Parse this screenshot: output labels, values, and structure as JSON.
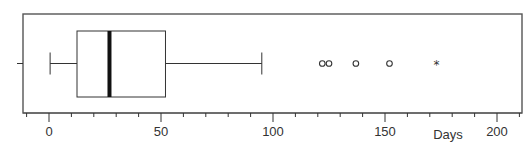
{
  "chart_data": {
    "type": "boxplot",
    "title": "",
    "xlabel": "Days",
    "ylabel": "",
    "orientation": "horizontal",
    "xlim": [
      -12,
      210
    ],
    "grid": false,
    "major_ticks": [
      0,
      50,
      100,
      150,
      200
    ],
    "tick_labels": [
      "0",
      "50",
      "100",
      "150",
      "200"
    ],
    "minor_ticks": [
      -10,
      10,
      20,
      30,
      40,
      60,
      70,
      80,
      90,
      110,
      120,
      130,
      140,
      160,
      170,
      180,
      190,
      210
    ],
    "box": {
      "whisker_low": 0.5,
      "q1": 12.5,
      "median": 27,
      "q3": 52,
      "whisker_high": 95
    },
    "outliers": [
      {
        "value": 122,
        "marker": "circle"
      },
      {
        "value": 125,
        "marker": "circle"
      },
      {
        "value": 137,
        "marker": "circle"
      },
      {
        "value": 152,
        "marker": "circle"
      },
      {
        "value": 173,
        "marker": "star"
      }
    ],
    "colors": {
      "line": "#333333",
      "median": "#111111",
      "frame": "#555555"
    }
  }
}
